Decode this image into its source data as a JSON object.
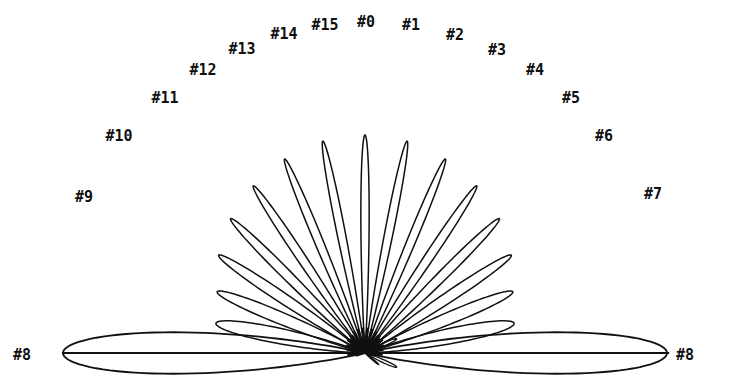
{
  "figure": {
    "kind": "antenna-array-beam-pattern",
    "background_color": "#ffffff",
    "ink_color": "#101010",
    "width": 731,
    "height": 379
  },
  "chart_data": {
    "type": "line",
    "title": "",
    "subtitle": "",
    "xlabel": "",
    "ylabel": "",
    "grid": false,
    "legend_position": "inline-annotations",
    "projection": "polar-half-plane",
    "origin_px": [
      365,
      353
    ],
    "baseline_y_px": 353,
    "baseline_x_range_px": [
      63,
      668
    ],
    "angle_step_deg": 11.25,
    "beam_count": 16,
    "categories": [
      "#0",
      "#1",
      "#2",
      "#3",
      "#4",
      "#5",
      "#6",
      "#7",
      "#8",
      "#9",
      "#10",
      "#11",
      "#12",
      "#13",
      "#14",
      "#15"
    ],
    "series": [
      {
        "name": "beam-lobe-tip-angle-deg",
        "values": [
          90,
          78.75,
          67.5,
          56.25,
          45,
          33.75,
          22.5,
          11.25,
          0,
          168.75,
          157.5,
          146.25,
          135,
          123.75,
          112.5,
          101.25
        ]
      },
      {
        "name": "beam-lobe-length-px",
        "values": [
          218,
          216,
          210,
          201,
          190,
          176,
          160,
          152,
          302,
          152,
          160,
          176,
          190,
          201,
          210,
          216
        ]
      },
      {
        "name": "beam-lobe-halfwidth-deg",
        "values": [
          3.6,
          3.7,
          3.9,
          4.3,
          4.9,
          5.8,
          7.2,
          9.6,
          13.0,
          9.6,
          7.2,
          5.8,
          4.9,
          4.3,
          3.9,
          3.7
        ]
      }
    ],
    "annotations": [
      {
        "label": "#0",
        "x": 366,
        "y": 22,
        "beam": 0
      },
      {
        "label": "#1",
        "x": 411,
        "y": 25,
        "beam": 1
      },
      {
        "label": "#2",
        "x": 455,
        "y": 35,
        "beam": 2
      },
      {
        "label": "#3",
        "x": 497,
        "y": 50,
        "beam": 3
      },
      {
        "label": "#4",
        "x": 535,
        "y": 70,
        "beam": 4
      },
      {
        "label": "#5",
        "x": 571,
        "y": 98,
        "beam": 5
      },
      {
        "label": "#6",
        "x": 604,
        "y": 136,
        "beam": 6
      },
      {
        "label": "#7",
        "x": 653,
        "y": 194,
        "beam": 7
      },
      {
        "label": "#8",
        "x": 685,
        "y": 355,
        "beam": 8
      },
      {
        "label": "#8",
        "x": 22,
        "y": 355,
        "beam": 8
      },
      {
        "label": "#9",
        "x": 84,
        "y": 197,
        "beam": 9
      },
      {
        "label": "#10",
        "x": 119,
        "y": 136,
        "beam": 10
      },
      {
        "label": "#11",
        "x": 165,
        "y": 98,
        "beam": 11
      },
      {
        "label": "#12",
        "x": 203,
        "y": 70,
        "beam": 12
      },
      {
        "label": "#13",
        "x": 242,
        "y": 49,
        "beam": 13
      },
      {
        "label": "#14",
        "x": 284,
        "y": 34,
        "beam": 14
      },
      {
        "label": "#15",
        "x": 325,
        "y": 25,
        "beam": 15
      }
    ]
  }
}
